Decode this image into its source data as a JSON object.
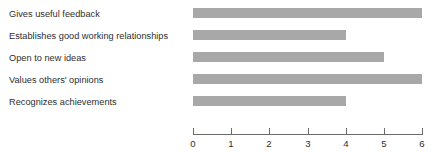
{
  "chart_data": {
    "type": "bar",
    "orientation": "horizontal",
    "title": "",
    "xlabel": "",
    "ylabel": "",
    "categories": [
      "Gives useful feedback",
      "Establishes good working relationships",
      "Open to new ideas",
      "Values others' opinions",
      "Recognizes achievements"
    ],
    "values": [
      6,
      4,
      5,
      6,
      4
    ],
    "xlim": [
      0,
      6
    ],
    "xticks": [
      0,
      1,
      2,
      3,
      4,
      5,
      6
    ],
    "xtick_labels": [
      "0",
      "1",
      "2",
      "3",
      "4",
      "5",
      "6"
    ],
    "grid": false,
    "legend": false,
    "bar_color": "#a8a8a8",
    "axis_color": "#6b6b6b",
    "text_color": "#2e2e2e"
  }
}
